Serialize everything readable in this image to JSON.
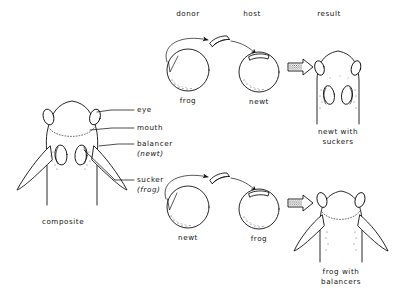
{
  "figure": {
    "title_columns": {
      "donor": "donor",
      "host": "host",
      "result": "result"
    },
    "composite": {
      "caption": "composite",
      "labels": [
        {
          "key": "eye",
          "text": "eye"
        },
        {
          "key": "mouth",
          "text": "mouth"
        },
        {
          "key": "balancer",
          "text": "balancer",
          "sub": "(newt)"
        },
        {
          "key": "sucker",
          "text": "sucker",
          "sub": "(frog)"
        }
      ]
    },
    "rows": [
      {
        "id": "row-top",
        "donor_label": "frog",
        "host_label": "newt",
        "result_label_line1": "newt with",
        "result_label_line2": "suckers"
      },
      {
        "id": "row-bottom",
        "donor_label": "newt",
        "host_label": "frog",
        "result_label_line1": "frog with",
        "result_label_line2": "balancers"
      }
    ],
    "icons": {
      "transplant_arrow": "curved-transplant-arrow",
      "result_arrow": "block-arrow-right",
      "graft_tissue": "graft-tissue-block"
    },
    "colors": {
      "ink": "#111111",
      "background": "#ffffff",
      "stipple": "#4a4a4a"
    }
  }
}
